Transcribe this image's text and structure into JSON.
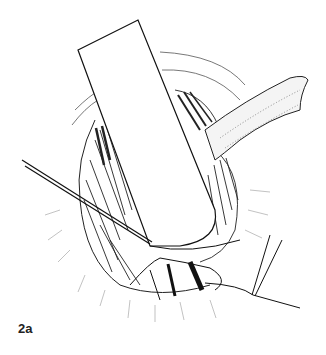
{
  "figure": {
    "label": "2a",
    "colors": {
      "ink": "#1a1a1a",
      "background": "#ffffff"
    }
  }
}
